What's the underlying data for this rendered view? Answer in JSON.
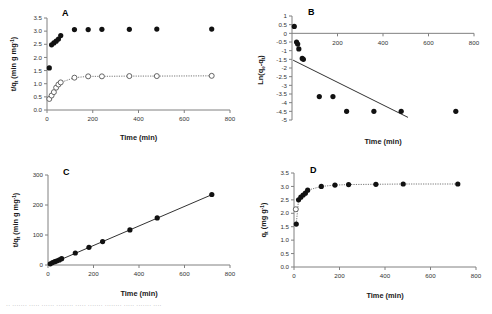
{
  "figure": {
    "panels": [
      {
        "letter": "A",
        "xlabel": "Time (min)",
        "ylabel_main": "t/q",
        "ylabel_sub": "t",
        "ylabel_rest": " (min g mg",
        "ylabel_sup": "-1",
        "ylabel_close": ")",
        "xticks": [
          "0",
          "200",
          "400",
          "600",
          "800"
        ],
        "yticks": [
          "0.0",
          "0.5",
          "1.0",
          "1.5",
          "2.0",
          "2.5",
          "3.0",
          "3.5"
        ]
      },
      {
        "letter": "B",
        "xlabel": "Time (min)",
        "ylabel_main": "Ln(q",
        "ylabel_sub": "e",
        "ylabel_rest": "-q",
        "ylabel_sub2": "t",
        "ylabel_close": ")",
        "xticks": [
          "200",
          "400",
          "600",
          "800"
        ],
        "yticks": [
          "1",
          "0.5",
          "0",
          "-0.5",
          "-1",
          "-1.5",
          "-2",
          "-2.5",
          "-3",
          "-3.5",
          "-4",
          "-4.5",
          "-5"
        ]
      },
      {
        "letter": "C",
        "xlabel": "Time (min)",
        "ylabel_main": "t/q",
        "ylabel_sub": "t",
        "ylabel_rest": " (min g mg",
        "ylabel_sup": "-1",
        "ylabel_close": ")",
        "xticks": [
          "0",
          "200",
          "400",
          "600",
          "800"
        ],
        "yticks": [
          "0",
          "100",
          "200",
          "300"
        ]
      },
      {
        "letter": "D",
        "xlabel": "Time (min)",
        "ylabel_main": "q",
        "ylabel_sub": "t",
        "ylabel_rest": " (mg g",
        "ylabel_sup": "-1",
        "ylabel_close": ")",
        "xticks": [
          "0",
          "200",
          "400",
          "600",
          "800"
        ],
        "yticks": [
          "0.0",
          "0.5",
          "1.0",
          "1.5",
          "2.0",
          "2.5",
          "3.0",
          "3.5"
        ]
      }
    ]
  },
  "chart_data": [
    {
      "type": "scatter",
      "panel": "A",
      "title": "A",
      "xlabel": "Time (min)",
      "ylabel": "t/qt (min g mg-1)",
      "xlim": [
        0,
        800
      ],
      "ylim": [
        0.0,
        3.5
      ],
      "grid": false,
      "legend": "none",
      "series": [
        {
          "name": "filled-circles",
          "marker": "filled-circle",
          "x": [
            10,
            20,
            30,
            40,
            50,
            60,
            120,
            180,
            240,
            360,
            480,
            720
          ],
          "y": [
            1.6,
            2.48,
            2.55,
            2.62,
            2.7,
            2.83,
            3.06,
            3.06,
            3.07,
            3.07,
            3.08,
            3.08
          ]
        },
        {
          "name": "open-circles",
          "marker": "open-circle",
          "line": "dotted",
          "x": [
            10,
            20,
            30,
            40,
            50,
            60,
            120,
            180,
            240,
            360,
            480,
            720
          ],
          "y": [
            0.42,
            0.55,
            0.68,
            0.85,
            0.97,
            1.05,
            1.23,
            1.28,
            1.28,
            1.29,
            1.29,
            1.3
          ]
        }
      ]
    },
    {
      "type": "scatter",
      "panel": "B",
      "title": "B",
      "xlabel": "Time (min)",
      "ylabel": "Ln(qe-qt)",
      "xlim": [
        0,
        800
      ],
      "ylim": [
        -5,
        1
      ],
      "grid": false,
      "legend": "none",
      "series": [
        {
          "name": "ln-data",
          "marker": "filled-circle",
          "x": [
            10,
            20,
            25,
            30,
            45,
            50,
            120,
            180,
            240,
            360,
            480,
            720
          ],
          "y": [
            0.4,
            -0.5,
            -0.62,
            -0.9,
            -1.45,
            -1.5,
            -3.65,
            -3.65,
            -4.5,
            -4.5,
            -4.5,
            -4.5
          ]
        }
      ],
      "trendline": {
        "name": "linear-fit",
        "x": [
          5,
          510
        ],
        "y": [
          -1.55,
          -4.85
        ]
      }
    },
    {
      "type": "scatter",
      "panel": "C",
      "title": "C",
      "xlabel": "Time (min)",
      "ylabel": "t/qt (min g mg-1)",
      "xlim": [
        0,
        800
      ],
      "ylim": [
        0,
        300
      ],
      "grid": false,
      "legend": "none",
      "series": [
        {
          "name": "pseudo-second-order",
          "marker": "filled-circle",
          "x": [
            10,
            20,
            30,
            40,
            50,
            60,
            120,
            180,
            240,
            360,
            480,
            720
          ],
          "y": [
            4,
            8,
            11,
            14,
            17,
            21,
            40,
            59,
            78,
            117,
            157,
            235
          ]
        }
      ],
      "trendline": {
        "name": "linear-fit",
        "x": [
          10,
          725
        ],
        "y": [
          3,
          236
        ]
      }
    },
    {
      "type": "scatter",
      "panel": "D",
      "title": "D",
      "xlabel": "Time (min)",
      "ylabel": "qt (mg g-1)",
      "xlim": [
        0,
        800
      ],
      "ylim": [
        0.0,
        3.5
      ],
      "grid": false,
      "legend": "none",
      "series": [
        {
          "name": "qt-filled",
          "marker": "filled-circle",
          "line": "dotted",
          "x": [
            10,
            20,
            30,
            40,
            50,
            60,
            120,
            180,
            240,
            360,
            480,
            720
          ],
          "y": [
            1.6,
            2.5,
            2.6,
            2.68,
            2.75,
            2.86,
            3.0,
            3.05,
            3.07,
            3.08,
            3.09,
            3.09
          ]
        },
        {
          "name": "qt-open",
          "marker": "open-circle",
          "x": [
            8
          ],
          "y": [
            2.15
          ]
        }
      ]
    }
  ],
  "caption_strip": {
    "line1": "··  ·······  ·····   ······  ········   ·····  ·······   ········  ·····   ·······   ····"
  }
}
